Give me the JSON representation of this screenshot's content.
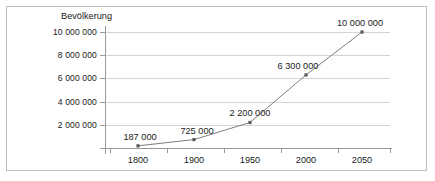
{
  "chart_data": {
    "type": "line",
    "title": "",
    "axis_title_y": "Bevölkerung",
    "xlabel": "",
    "ylabel": "Bevölkerung",
    "categories": [
      "1800",
      "1900",
      "1950",
      "2000",
      "2050"
    ],
    "values": [
      187000,
      725000,
      2200000,
      6300000,
      10000000
    ],
    "point_labels": [
      "187 000",
      "725 000",
      "2 200 000",
      "6 300 000",
      "10 000 000"
    ],
    "ylim": [
      0,
      10000000
    ],
    "ytick_values": [
      2000000,
      4000000,
      6000000,
      8000000,
      10000000
    ],
    "ytick_labels": [
      "2 000 000",
      "4 000 000",
      "6 000 000",
      "8 000 000",
      "10 000 000"
    ],
    "grid": true,
    "grid_axis": "y",
    "legend": false,
    "legend_position": "none",
    "series": [
      {
        "name": "Bevölkerung",
        "values": [
          187000,
          725000,
          2200000,
          6300000,
          10000000
        ]
      }
    ],
    "colors": {
      "line": "#7f7f7f",
      "marker": "#595959",
      "gridline": "#d4d4d4",
      "axis": "#9a9a9a",
      "text": "#1a1a1a",
      "frame": "#bfbfbf",
      "background": "#ffffff"
    }
  }
}
